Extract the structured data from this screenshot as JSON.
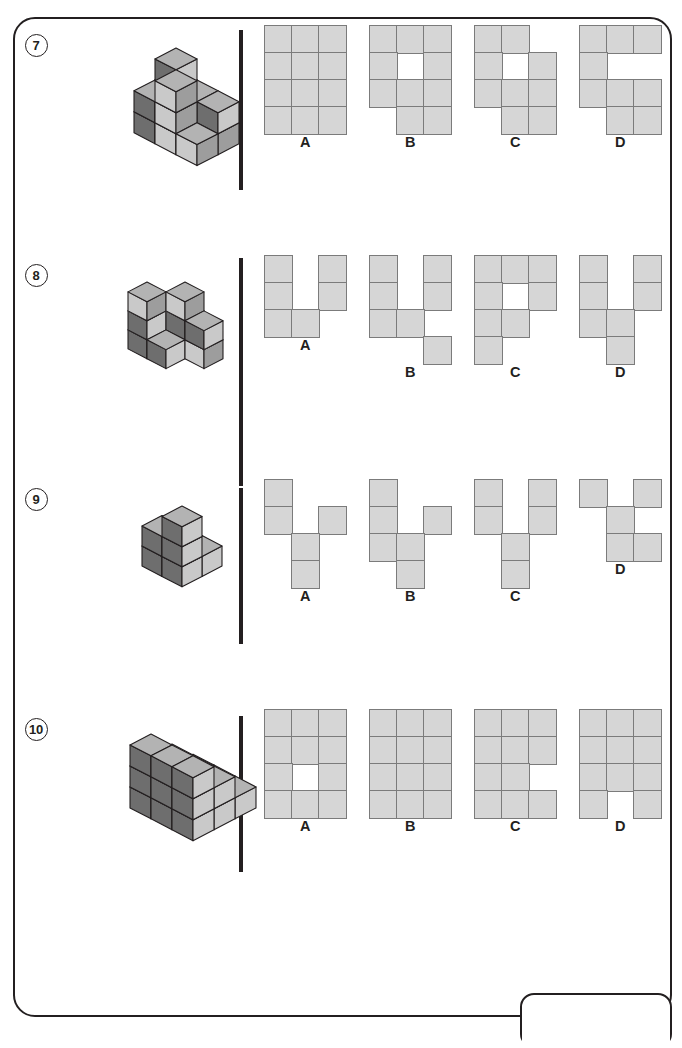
{
  "page": {
    "width": 682,
    "height": 1048,
    "background": "#ffffff",
    "border_color": "#231f20"
  },
  "palette": {
    "cube_top": "#b3b3b3",
    "cube_front_dark": "#6e6e6e",
    "cube_side_light": "#c9c9c9",
    "cube_outline": "#231f20",
    "flat_cell_fill": "#d6d6d6",
    "flat_cell_stroke": "#7b7b7b",
    "ink": "#231f20"
  },
  "layout": {
    "option_cell_size": 27,
    "option_labels": [
      "A",
      "B",
      "C",
      "D"
    ]
  },
  "questions": [
    {
      "number": "7",
      "figure_name": "cube-stack-figure-7",
      "figure": {
        "iso_cubes": [
          {
            "x": 0,
            "y": 0,
            "z": 0,
            "shade": "dark"
          },
          {
            "x": 1,
            "y": 0,
            "z": 0,
            "shade": "dark"
          },
          {
            "x": 2,
            "y": 0,
            "z": 0,
            "shade": "light"
          },
          {
            "x": 0,
            "y": 1,
            "z": 0,
            "shade": "dark"
          },
          {
            "x": 1,
            "y": 1,
            "z": 0,
            "shade": "light"
          },
          {
            "x": 2,
            "y": 1,
            "z": 0,
            "shade": "light"
          },
          {
            "x": 0,
            "y": 0,
            "z": 1,
            "shade": "dark"
          },
          {
            "x": 1,
            "y": 0,
            "z": 1,
            "shade": "light"
          },
          {
            "x": 2,
            "y": 0,
            "z": 1,
            "shade": "dark"
          },
          {
            "x": 0,
            "y": 1,
            "z": 1,
            "shade": "dark"
          },
          {
            "x": 1,
            "y": 1,
            "z": 1,
            "shade": "light"
          },
          {
            "x": 0,
            "y": 0,
            "z": 2,
            "shade": "dark"
          },
          {
            "x": 1,
            "y": 1,
            "z": 2,
            "shade": "light"
          }
        ]
      },
      "options": [
        {
          "label": "A",
          "name": "option-a",
          "cols": 3,
          "rows": 4,
          "grid": [
            [
              1,
              1,
              1
            ],
            [
              1,
              1,
              1
            ],
            [
              1,
              1,
              1
            ],
            [
              1,
              1,
              1
            ]
          ]
        },
        {
          "label": "B",
          "name": "option-b",
          "cols": 3,
          "rows": 4,
          "grid": [
            [
              1,
              1,
              1
            ],
            [
              1,
              0,
              1
            ],
            [
              1,
              1,
              1
            ],
            [
              0,
              1,
              1
            ]
          ]
        },
        {
          "label": "C",
          "name": "option-c",
          "cols": 3,
          "rows": 4,
          "grid": [
            [
              1,
              1,
              0
            ],
            [
              1,
              0,
              1
            ],
            [
              1,
              1,
              1
            ],
            [
              0,
              1,
              1
            ]
          ]
        },
        {
          "label": "D",
          "name": "option-d",
          "cols": 3,
          "rows": 4,
          "grid": [
            [
              1,
              1,
              1
            ],
            [
              1,
              0,
              0
            ],
            [
              1,
              1,
              1
            ],
            [
              0,
              1,
              1
            ]
          ]
        }
      ]
    },
    {
      "number": "8",
      "figure_name": "cube-stack-figure-8",
      "figure": {
        "iso_cubes": [
          {
            "x": 0,
            "y": 1,
            "z": 0,
            "shade": "dark"
          },
          {
            "x": 1,
            "y": 1,
            "z": 0,
            "shade": "dark"
          },
          {
            "x": 1,
            "y": 0,
            "z": 0,
            "shade": "dark"
          },
          {
            "x": 2,
            "y": 0,
            "z": 0,
            "shade": "light"
          },
          {
            "x": 0,
            "y": 1,
            "z": 1,
            "shade": "dark"
          },
          {
            "x": 1,
            "y": 0,
            "z": 1,
            "shade": "dark"
          },
          {
            "x": 2,
            "y": 0,
            "z": 1,
            "shade": "dark"
          },
          {
            "x": 0,
            "y": 1,
            "z": 2,
            "shade": "light"
          },
          {
            "x": 1,
            "y": 0,
            "z": 2,
            "shade": "light"
          }
        ]
      },
      "options": [
        {
          "label": "A",
          "name": "option-a",
          "cols": 3,
          "rows": 3,
          "grid": [
            [
              1,
              0,
              1
            ],
            [
              1,
              0,
              1
            ],
            [
              1,
              1,
              0
            ]
          ]
        },
        {
          "label": "B",
          "name": "option-b",
          "cols": 3,
          "rows": 4,
          "grid": [
            [
              1,
              0,
              1
            ],
            [
              1,
              0,
              1
            ],
            [
              1,
              1,
              0
            ],
            [
              0,
              0,
              1
            ]
          ]
        },
        {
          "label": "C",
          "name": "option-c",
          "cols": 3,
          "rows": 4,
          "grid": [
            [
              1,
              1,
              1
            ],
            [
              1,
              0,
              1
            ],
            [
              1,
              1,
              0
            ],
            [
              1,
              0,
              0
            ]
          ]
        },
        {
          "label": "D",
          "name": "option-d",
          "cols": 3,
          "rows": 4,
          "grid": [
            [
              1,
              0,
              1
            ],
            [
              1,
              0,
              1
            ],
            [
              1,
              1,
              0
            ],
            [
              0,
              1,
              0
            ]
          ]
        }
      ]
    },
    {
      "number": "9",
      "figure_name": "cube-stack-figure-9",
      "figure": {
        "iso_cubes": [
          {
            "x": 0,
            "y": 0,
            "z": 0,
            "shade": "dark"
          },
          {
            "x": 1,
            "y": 0,
            "z": 0,
            "shade": "dark"
          },
          {
            "x": 1,
            "y": 1,
            "z": 0,
            "shade": "dark"
          },
          {
            "x": 0,
            "y": 1,
            "z": 0,
            "shade": "dark"
          },
          {
            "x": 0,
            "y": 1,
            "z": 1,
            "shade": "dark"
          },
          {
            "x": 1,
            "y": 1,
            "z": 1,
            "shade": "dark"
          },
          {
            "x": 1,
            "y": 1,
            "z": 2,
            "shade": "dark"
          }
        ]
      },
      "options": [
        {
          "label": "A",
          "name": "option-a",
          "cols": 3,
          "rows": 4,
          "grid": [
            [
              1,
              0,
              0
            ],
            [
              1,
              0,
              1
            ],
            [
              0,
              1,
              0
            ],
            [
              0,
              1,
              0
            ]
          ]
        },
        {
          "label": "B",
          "name": "option-b",
          "cols": 3,
          "rows": 4,
          "grid": [
            [
              1,
              0,
              0
            ],
            [
              1,
              0,
              1
            ],
            [
              1,
              1,
              0
            ],
            [
              0,
              1,
              0
            ]
          ]
        },
        {
          "label": "C",
          "name": "option-c",
          "cols": 3,
          "rows": 4,
          "grid": [
            [
              1,
              0,
              1
            ],
            [
              1,
              0,
              1
            ],
            [
              0,
              1,
              0
            ],
            [
              0,
              1,
              0
            ]
          ]
        },
        {
          "label": "D",
          "name": "option-d",
          "cols": 3,
          "rows": 3,
          "grid": [
            [
              1,
              0,
              1
            ],
            [
              0,
              1,
              0
            ],
            [
              0,
              1,
              1
            ]
          ]
        }
      ]
    },
    {
      "number": "10",
      "figure_name": "cube-stack-figure-10",
      "figure": {
        "iso_cubes": [
          {
            "x": 0,
            "y": 0,
            "z": 0,
            "shade": "dark"
          },
          {
            "x": 1,
            "y": 0,
            "z": 0,
            "shade": "dark"
          },
          {
            "x": 2,
            "y": 0,
            "z": 0,
            "shade": "dark"
          },
          {
            "x": 0,
            "y": 1,
            "z": 0,
            "shade": "dark"
          },
          {
            "x": 1,
            "y": 1,
            "z": 0,
            "shade": "dark"
          },
          {
            "x": 2,
            "y": 1,
            "z": 0,
            "shade": "dark"
          },
          {
            "x": 0,
            "y": 2,
            "z": 0,
            "shade": "dark"
          },
          {
            "x": 1,
            "y": 2,
            "z": 0,
            "shade": "dark"
          },
          {
            "x": 2,
            "y": 2,
            "z": 0,
            "shade": "dark"
          },
          {
            "x": 0,
            "y": 1,
            "z": 1,
            "shade": "dark"
          },
          {
            "x": 1,
            "y": 1,
            "z": 1,
            "shade": "dark"
          },
          {
            "x": 2,
            "y": 1,
            "z": 1,
            "shade": "dark"
          },
          {
            "x": 0,
            "y": 2,
            "z": 1,
            "shade": "dark"
          },
          {
            "x": 1,
            "y": 2,
            "z": 1,
            "shade": "dark"
          },
          {
            "x": 2,
            "y": 2,
            "z": 1,
            "shade": "dark"
          },
          {
            "x": 0,
            "y": 2,
            "z": 2,
            "shade": "dark"
          },
          {
            "x": 1,
            "y": 2,
            "z": 2,
            "shade": "dark"
          },
          {
            "x": 2,
            "y": 2,
            "z": 2,
            "shade": "dark"
          }
        ]
      },
      "options": [
        {
          "label": "A",
          "name": "option-a",
          "cols": 3,
          "rows": 4,
          "grid": [
            [
              1,
              1,
              1
            ],
            [
              1,
              1,
              1
            ],
            [
              1,
              0,
              1
            ],
            [
              1,
              1,
              1
            ]
          ]
        },
        {
          "label": "B",
          "name": "option-b",
          "cols": 3,
          "rows": 4,
          "grid": [
            [
              1,
              1,
              1
            ],
            [
              1,
              1,
              1
            ],
            [
              1,
              1,
              1
            ],
            [
              1,
              1,
              1
            ]
          ]
        },
        {
          "label": "C",
          "name": "option-c",
          "cols": 3,
          "rows": 4,
          "grid": [
            [
              1,
              1,
              1
            ],
            [
              1,
              1,
              1
            ],
            [
              1,
              1,
              0
            ],
            [
              1,
              1,
              1
            ]
          ]
        },
        {
          "label": "D",
          "name": "option-d",
          "cols": 3,
          "rows": 4,
          "grid": [
            [
              1,
              1,
              1
            ],
            [
              1,
              1,
              1
            ],
            [
              1,
              1,
              1
            ],
            [
              1,
              0,
              1
            ]
          ]
        }
      ]
    }
  ]
}
